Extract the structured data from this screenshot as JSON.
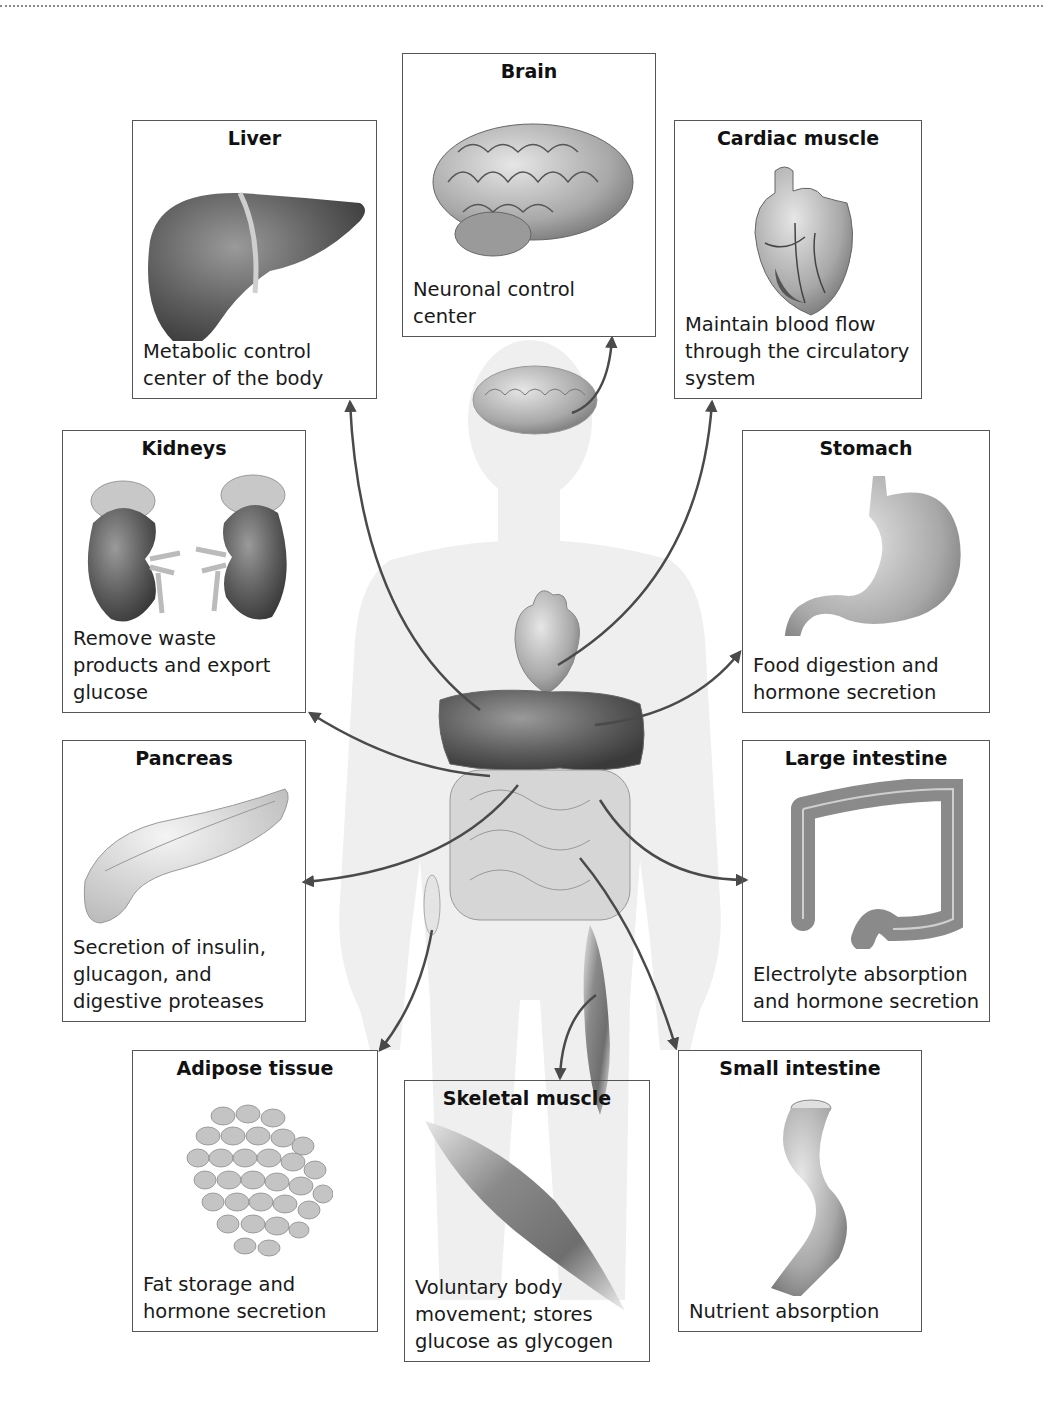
{
  "figure": {
    "body_silhouette": "human-body-silhouette",
    "boxes": [
      {
        "id": "brain",
        "title": "Brain",
        "description": "Neuronal control center",
        "desc_lines": [
          "Neuronal control",
          "center"
        ]
      },
      {
        "id": "liver",
        "title": "Liver",
        "description": "Metabolic control center of the body",
        "desc_lines": [
          "Metabolic control",
          "center of the body"
        ]
      },
      {
        "id": "cardiac",
        "title": "Cardiac muscle",
        "description": "Maintain blood flow through the circulatory system",
        "desc_lines": [
          "Maintain blood flow",
          "through the circulatory",
          "system"
        ]
      },
      {
        "id": "kidneys",
        "title": "Kidneys",
        "description": "Remove waste products and export glucose",
        "desc_lines": [
          "Remove waste",
          "products and export",
          "glucose"
        ]
      },
      {
        "id": "stomach",
        "title": "Stomach",
        "description": "Food digestion and hormone secretion",
        "desc_lines": [
          "Food digestion and",
          "hormone secretion"
        ]
      },
      {
        "id": "pancreas",
        "title": "Pancreas",
        "description": "Secretion of insulin, glucagon, and digestive proteases",
        "desc_lines": [
          "Secretion of insulin,",
          "glucagon, and",
          "digestive proteases"
        ]
      },
      {
        "id": "large_intestine",
        "title": "Large intestine",
        "description": "Electrolyte absorption and hormone secretion",
        "desc_lines": [
          "Electrolyte absorption",
          "and hormone secretion"
        ]
      },
      {
        "id": "adipose",
        "title": "Adipose tissue",
        "description": "Fat storage and hormone secretion",
        "desc_lines": [
          "Fat storage and",
          "hormone secretion"
        ]
      },
      {
        "id": "skeletal",
        "title": "Skeletal muscle",
        "description": "Voluntary body movement; stores glucose as glycogen",
        "desc_lines": [
          "Voluntary body",
          "movement; stores",
          "glucose as glycogen"
        ]
      },
      {
        "id": "small_intestine",
        "title": "Small intestine",
        "description": "Nutrient absorption",
        "desc_lines": [
          "Nutrient absorption"
        ]
      }
    ]
  },
  "colors": {
    "arrow": "#4a4a4a",
    "box_border": "#555555",
    "silhouette": "#eeeeee",
    "organ_dark": "#5a5a5a",
    "organ_light": "#c8c8c8"
  }
}
